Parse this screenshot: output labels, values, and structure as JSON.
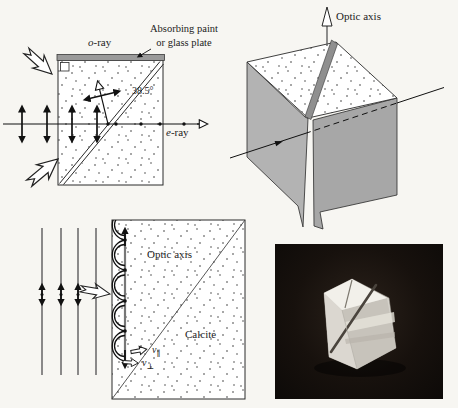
{
  "colors": {
    "paper": "#f7f6f2",
    "ink": "#1c1c1c",
    "line-gray": "#6e6e6e",
    "plate-gray": "#9a9a9a",
    "cube-face-light": "#b3b3b3",
    "cube-face-dark": "#a7a7a7",
    "slit-gray": "#8f8f8f",
    "photo-background": "#17110d",
    "crystal-white": "#e9e7e1"
  },
  "glan_prism_panel": {
    "o_ray_prefix": "o",
    "o_ray_suffix": "-ray",
    "absorbing_label_line1": "Absorbing paint",
    "absorbing_label_line2": "or glass plate",
    "apex_angle": "38.5°",
    "e_ray_prefix": "e",
    "e_ray_suffix": "-ray"
  },
  "crystal_cube_panel": {
    "optic_axis_label": "Optic axis"
  },
  "huygens_panel": {
    "optic_axis_label": "Optic axis",
    "medium_label": "Calcite",
    "v_parallel_base": "v",
    "v_parallel_sub": "∥",
    "v_perp_base": "v",
    "v_perp_sub": "⊥"
  }
}
